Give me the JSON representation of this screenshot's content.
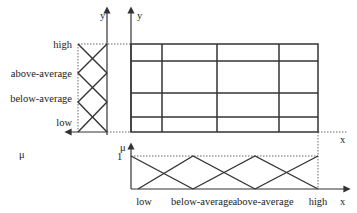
{
  "left_panel": {
    "y_axis_label": "y",
    "mu_label": "μ",
    "sets": [
      "high",
      "above-average",
      "below-average",
      "low"
    ]
  },
  "main_panel": {
    "y_axis_label": "y",
    "x_axis_label": "x"
  },
  "bottom_panel": {
    "mu_label": "μ",
    "one_label": "1",
    "x_axis_label": "x",
    "sets": [
      "low",
      "below-average",
      "above-average",
      "high"
    ]
  }
}
